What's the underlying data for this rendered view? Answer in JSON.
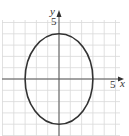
{
  "chart_data": {
    "type": "line",
    "title": "",
    "curve": "ellipse",
    "equation": "x^2/9 + y^2/16 = 1",
    "center": [
      0,
      0
    ],
    "semi_axis_x": 3,
    "semi_axis_y": 4,
    "xlabel": "x",
    "ylabel": "y",
    "xlim": [
      -5,
      6
    ],
    "ylim": [
      -5,
      6
    ],
    "x_tick_labels": [
      "5"
    ],
    "y_tick_labels": [
      "5"
    ],
    "grid": true,
    "key_points": [
      {
        "x": 3,
        "y": 0
      },
      {
        "x": -3,
        "y": 0
      },
      {
        "x": 0,
        "y": 4
      },
      {
        "x": 0,
        "y": -4
      }
    ]
  },
  "labels": {
    "x_axis": "x",
    "y_axis": "y",
    "x_tick": "5",
    "y_tick": "5"
  },
  "colors": {
    "grid": "#d9d9d9",
    "axis": "#555555",
    "curve": "#333333"
  }
}
